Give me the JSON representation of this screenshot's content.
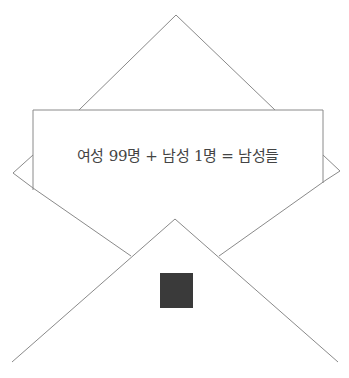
{
  "diagram": {
    "type": "envelope-with-letter",
    "letter_text": "여성 99명 + 남성 1명 = 남성들",
    "colors": {
      "line": "#8a8a8a",
      "text": "#444444",
      "stamp": "#3a3a3a",
      "background": "#ffffff"
    },
    "elements": [
      "envelope-top-flap",
      "letter-card",
      "envelope-side-flaps",
      "envelope-bottom-flap",
      "stamp"
    ]
  }
}
